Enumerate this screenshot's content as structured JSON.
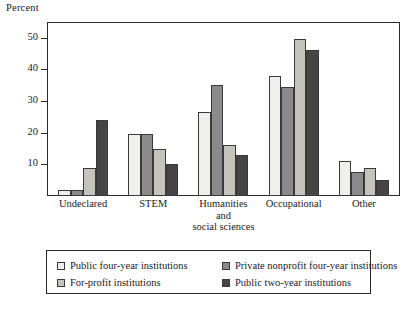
{
  "chart_data": {
    "type": "bar",
    "title": "",
    "ylabel": "Percent",
    "xlabel": "",
    "ylim": [
      0,
      55
    ],
    "yticks": [
      10,
      20,
      30,
      40,
      50
    ],
    "grid": false,
    "legend_position": "bottom",
    "categories": [
      "Undeclared",
      "STEM",
      "Humanities and social sciences",
      "Occupational",
      "Other"
    ],
    "category_lines": [
      [
        "Undeclared"
      ],
      [
        "STEM"
      ],
      [
        "Humanities",
        "and",
        "social sciences"
      ],
      [
        "Occupational"
      ],
      [
        "Other"
      ]
    ],
    "series": [
      {
        "name": "Public four-year institutions",
        "color": "#efefeb",
        "values": [
          2,
          19.5,
          26.5,
          38,
          11
        ]
      },
      {
        "name": "Private nonprofit four-year institutions",
        "color": "#8a8a8a",
        "values": [
          2,
          19.5,
          35,
          34.5,
          7.5
        ]
      },
      {
        "name": "For-profit institutions",
        "color": "#c4c4bd",
        "values": [
          9,
          15,
          16,
          49.5,
          9
        ]
      },
      {
        "name": "Public two-year institutions",
        "color": "#454545",
        "values": [
          24,
          10,
          13,
          46,
          5
        ]
      }
    ]
  },
  "legend": {
    "items": [
      {
        "label": "Public four-year institutions",
        "color": "#efefeb"
      },
      {
        "label": "Private nonprofit four-year institutions",
        "color": "#8a8a8a"
      },
      {
        "label": "For-profit institutions",
        "color": "#c4c4bd"
      },
      {
        "label": "Public two-year institutions",
        "color": "#454545"
      }
    ]
  },
  "axis": {
    "y_title": "Percent",
    "y_tick_labels": [
      "50",
      "40",
      "30",
      "20",
      "10"
    ]
  }
}
